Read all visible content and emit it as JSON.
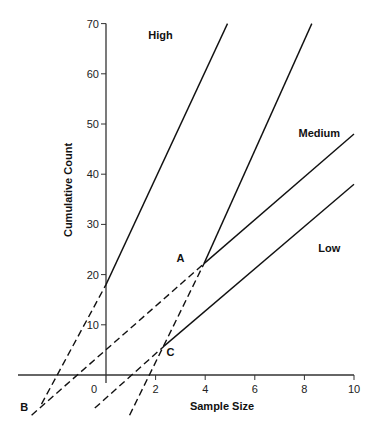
{
  "chart_data": {
    "type": "line",
    "title": "",
    "xlabel": "Sample Size",
    "ylabel": "Cumulative Count",
    "xlim": [
      -3.5,
      10
    ],
    "ylim": [
      -9,
      70
    ],
    "x_ticks": [
      0,
      2,
      4,
      6,
      8,
      10
    ],
    "x_tick_labels": [
      "0",
      "2",
      "4",
      "6",
      "8",
      "10"
    ],
    "y_ticks": [
      10,
      20,
      30,
      40,
      50,
      60,
      70
    ],
    "y_tick_labels": [
      "10",
      "20",
      "30",
      "40",
      "50",
      "60",
      "70"
    ],
    "grid": false,
    "legend": "none",
    "series": [
      {
        "name": "High",
        "style": "solid",
        "x": [
          0,
          4.9
        ],
        "y": [
          18,
          70
        ]
      },
      {
        "name": "High (extrapolated)",
        "style": "dashed",
        "x": [
          -2.6,
          0
        ],
        "y": [
          -5.8,
          18
        ]
      },
      {
        "name": "Steep through A",
        "style": "solid",
        "x": [
          3.95,
          8.3
        ],
        "y": [
          22.2,
          70
        ]
      },
      {
        "name": "Steep through A (extrapolated)",
        "style": "dashed",
        "x": [
          0.95,
          3.95
        ],
        "y": [
          -8.0,
          22.2
        ]
      },
      {
        "name": "Medium",
        "style": "solid",
        "x": [
          3.95,
          10
        ],
        "y": [
          22.2,
          48
        ]
      },
      {
        "name": "Medium (extrapolated)",
        "style": "dashed",
        "x": [
          -3.0,
          3.95
        ],
        "y": [
          -8.0,
          22.2
        ]
      },
      {
        "name": "Low",
        "style": "solid",
        "x": [
          2.35,
          10
        ],
        "y": [
          5.8,
          38
        ]
      },
      {
        "name": "Low (extrapolated)",
        "style": "dashed",
        "x": [
          -0.45,
          2.35
        ],
        "y": [
          -6.6,
          5.8
        ]
      }
    ],
    "annotations": [
      {
        "text": "High",
        "x": 2.2,
        "y": 67
      },
      {
        "text": "Medium",
        "x": 8.6,
        "y": 47.5
      },
      {
        "text": "Low",
        "x": 9.0,
        "y": 24.5
      },
      {
        "text": "A",
        "x": 3.0,
        "y": 22.5
      },
      {
        "text": "B",
        "x": -3.3,
        "y": -7.2
      },
      {
        "text": "C",
        "x": 2.6,
        "y": 3.8
      }
    ],
    "colors": {
      "line": "#111111",
      "axis": "#333333",
      "text": "#111111"
    }
  }
}
